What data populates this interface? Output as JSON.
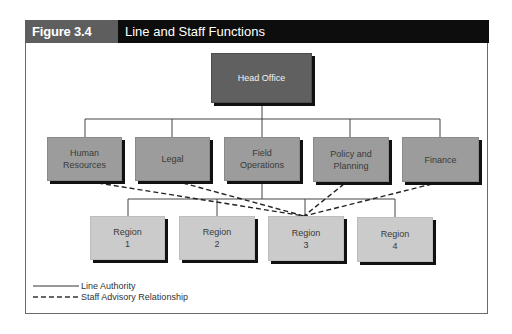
{
  "figure": {
    "label": "Figure 3.4",
    "title": "Line and Staff Functions",
    "colors": {
      "header_bg": "#0d0d0d",
      "label_bg": "#5e5e5e",
      "head_box": "#606060",
      "dept_box": "#9c9c9c",
      "region_box": "#cbcbcb"
    }
  },
  "org_chart": {
    "head": {
      "label": "Head Office"
    },
    "departments": [
      {
        "label": "Human\nResources",
        "type": "staff"
      },
      {
        "label": "Legal",
        "type": "staff"
      },
      {
        "label": "Field\nOperations",
        "type": "line"
      },
      {
        "label": "Policy and\nPlanning",
        "type": "staff"
      },
      {
        "label": "Finance",
        "type": "staff"
      }
    ],
    "regions": [
      {
        "label": "Region\n1"
      },
      {
        "label": "Region\n2"
      },
      {
        "label": "Region\n3"
      },
      {
        "label": "Region\n4"
      }
    ],
    "edges": {
      "line_authority": [
        [
          "Head Office",
          "Human Resources"
        ],
        [
          "Head Office",
          "Legal"
        ],
        [
          "Head Office",
          "Field Operations"
        ],
        [
          "Head Office",
          "Policy and Planning"
        ],
        [
          "Head Office",
          "Finance"
        ],
        [
          "Field Operations",
          "Region 1"
        ],
        [
          "Field Operations",
          "Region 2"
        ],
        [
          "Field Operations",
          "Region 3"
        ],
        [
          "Field Operations",
          "Region 4"
        ]
      ],
      "staff_advisory": [
        [
          "Human Resources",
          "Region 3"
        ],
        [
          "Legal",
          "Region 3"
        ],
        [
          "Policy and Planning",
          "Region 3"
        ],
        [
          "Finance",
          "Region 3"
        ]
      ]
    }
  },
  "legend": {
    "items": [
      {
        "style": "solid",
        "label": "Line Authority"
      },
      {
        "style": "dashed",
        "label": "Staff Advisory Relationship"
      }
    ]
  }
}
